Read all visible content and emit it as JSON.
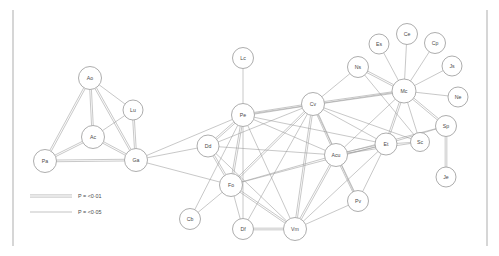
{
  "figure": {
    "kind": "network-graph",
    "background_color": "#ffffff",
    "node_fill": "#ffffff",
    "node_stroke": "#8a8a8a",
    "edge_color": "#9a9a9a",
    "frame_color": "#b5b5b5",
    "label_color": "#4a4a4a"
  },
  "frame": {
    "left_rule": {
      "x": 13,
      "y1": 10,
      "y2": 246
    },
    "right_rule": {
      "x": 487,
      "y1": 10,
      "y2": 246
    }
  },
  "legend": {
    "items": [
      {
        "id": "legend-strong",
        "style": "double",
        "label": "P = <0·01"
      },
      {
        "id": "legend-weak",
        "style": "single",
        "label": "P = <0·05"
      }
    ]
  },
  "chart_data": {
    "type": "scatter",
    "title": "",
    "xlabel": "",
    "ylabel": "",
    "nodes": [
      {
        "id": "Pa",
        "label": "Pa",
        "x": 45,
        "y": 161,
        "r": 11.5
      },
      {
        "id": "Ao",
        "label": "Ao",
        "x": 90,
        "y": 78,
        "r": 11.5
      },
      {
        "id": "Ac",
        "label": "Ac",
        "x": 93,
        "y": 137,
        "r": 11.5
      },
      {
        "id": "Lu",
        "label": "Lu",
        "x": 133,
        "y": 110,
        "r": 10.0
      },
      {
        "id": "Ga",
        "label": "Ga",
        "x": 136,
        "y": 160,
        "r": 11.5
      },
      {
        "id": "Lc",
        "label": "Lc",
        "x": 243,
        "y": 58,
        "r": 10.5
      },
      {
        "id": "Pe",
        "label": "Pe",
        "x": 243,
        "y": 115,
        "r": 11.5
      },
      {
        "id": "Dd",
        "label": "Dd",
        "x": 208,
        "y": 146,
        "r": 11.0
      },
      {
        "id": "Fo",
        "label": "Fo",
        "x": 231,
        "y": 185,
        "r": 11.5
      },
      {
        "id": "Cb",
        "label": "Cb",
        "x": 190,
        "y": 219,
        "r": 10.5
      },
      {
        "id": "Df",
        "label": "Df",
        "x": 243,
        "y": 229,
        "r": 10.5
      },
      {
        "id": "Vm",
        "label": "Vm",
        "x": 295,
        "y": 229,
        "r": 11.5
      },
      {
        "id": "Cv",
        "label": "Cv",
        "x": 313,
        "y": 104,
        "r": 11.5
      },
      {
        "id": "Acu",
        "label": "Acu",
        "x": 336,
        "y": 155,
        "r": 11.5
      },
      {
        "id": "Et",
        "label": "Et",
        "x": 386,
        "y": 144,
        "r": 11.0
      },
      {
        "id": "Pv",
        "label": "Pv",
        "x": 358,
        "y": 201,
        "r": 10.5
      },
      {
        "id": "Mc",
        "label": "Mc",
        "x": 404,
        "y": 91,
        "r": 12.0
      },
      {
        "id": "Ns",
        "label": "Ns",
        "x": 358,
        "y": 67,
        "r": 10.5
      },
      {
        "id": "Es",
        "label": "Es",
        "x": 379,
        "y": 44,
        "r": 10.0
      },
      {
        "id": "Ce",
        "label": "Ce",
        "x": 407,
        "y": 34,
        "r": 10.5
      },
      {
        "id": "Cp",
        "label": "Cp",
        "x": 435,
        "y": 43,
        "r": 10.5
      },
      {
        "id": "Js",
        "label": "Js",
        "x": 452,
        "y": 66,
        "r": 10.0
      },
      {
        "id": "Ne",
        "label": "Ne",
        "x": 458,
        "y": 97,
        "r": 10.0
      },
      {
        "id": "Sp",
        "label": "Sp",
        "x": 446,
        "y": 126,
        "r": 10.5
      },
      {
        "id": "Sc",
        "label": "Sc",
        "x": 420,
        "y": 142,
        "r": 9.5
      },
      {
        "id": "Je",
        "label": "Je",
        "x": 446,
        "y": 177,
        "r": 10.0
      }
    ],
    "edges": [
      {
        "source": "Pa",
        "target": "Ao",
        "weight": "double"
      },
      {
        "source": "Pa",
        "target": "Ac",
        "weight": "double"
      },
      {
        "source": "Pa",
        "target": "Ga",
        "weight": "double"
      },
      {
        "source": "Ao",
        "target": "Ac",
        "weight": "double"
      },
      {
        "source": "Ao",
        "target": "Ga",
        "weight": "double"
      },
      {
        "source": "Ao",
        "target": "Lu",
        "weight": "single"
      },
      {
        "source": "Ac",
        "target": "Ga",
        "weight": "double"
      },
      {
        "source": "Ac",
        "target": "Lu",
        "weight": "single"
      },
      {
        "source": "Lu",
        "target": "Ga",
        "weight": "double"
      },
      {
        "source": "Ga",
        "target": "Pe",
        "weight": "single"
      },
      {
        "source": "Ga",
        "target": "Dd",
        "weight": "single"
      },
      {
        "source": "Ga",
        "target": "Fo",
        "weight": "single"
      },
      {
        "source": "Lc",
        "target": "Pe",
        "weight": "single"
      },
      {
        "source": "Pe",
        "target": "Dd",
        "weight": "double"
      },
      {
        "source": "Pe",
        "target": "Fo",
        "weight": "double"
      },
      {
        "source": "Pe",
        "target": "Cv",
        "weight": "double"
      },
      {
        "source": "Pe",
        "target": "Acu",
        "weight": "single"
      },
      {
        "source": "Pe",
        "target": "Vm",
        "weight": "single"
      },
      {
        "source": "Pe",
        "target": "Df",
        "weight": "single"
      },
      {
        "source": "Pe",
        "target": "Mc",
        "weight": "single"
      },
      {
        "source": "Pe",
        "target": "Et",
        "weight": "single"
      },
      {
        "source": "Dd",
        "target": "Fo",
        "weight": "double"
      },
      {
        "source": "Dd",
        "target": "Acu",
        "weight": "single"
      },
      {
        "source": "Dd",
        "target": "Cv",
        "weight": "single"
      },
      {
        "source": "Dd",
        "target": "Vm",
        "weight": "single"
      },
      {
        "source": "Fo",
        "target": "Cb",
        "weight": "single"
      },
      {
        "source": "Fo",
        "target": "Df",
        "weight": "single"
      },
      {
        "source": "Fo",
        "target": "Vm",
        "weight": "double"
      },
      {
        "source": "Fo",
        "target": "Cv",
        "weight": "double"
      },
      {
        "source": "Fo",
        "target": "Acu",
        "weight": "single"
      },
      {
        "source": "Fo",
        "target": "Et",
        "weight": "single"
      },
      {
        "source": "Cb",
        "target": "Pe",
        "weight": "single"
      },
      {
        "source": "Df",
        "target": "Vm",
        "weight": "double"
      },
      {
        "source": "Df",
        "target": "Cv",
        "weight": "single"
      },
      {
        "source": "Vm",
        "target": "Cv",
        "weight": "double"
      },
      {
        "source": "Vm",
        "target": "Acu",
        "weight": "double"
      },
      {
        "source": "Vm",
        "target": "Et",
        "weight": "single"
      },
      {
        "source": "Vm",
        "target": "Pv",
        "weight": "single"
      },
      {
        "source": "Cv",
        "target": "Acu",
        "weight": "double"
      },
      {
        "source": "Cv",
        "target": "Et",
        "weight": "single"
      },
      {
        "source": "Cv",
        "target": "Mc",
        "weight": "double"
      },
      {
        "source": "Cv",
        "target": "Ns",
        "weight": "single"
      },
      {
        "source": "Cv",
        "target": "Sc",
        "weight": "single"
      },
      {
        "source": "Cv",
        "target": "Pv",
        "weight": "single"
      },
      {
        "source": "Acu",
        "target": "Et",
        "weight": "double"
      },
      {
        "source": "Acu",
        "target": "Pv",
        "weight": "double"
      },
      {
        "source": "Acu",
        "target": "Mc",
        "weight": "single"
      },
      {
        "source": "Acu",
        "target": "Sc",
        "weight": "single"
      },
      {
        "source": "Acu",
        "target": "Sp",
        "weight": "single"
      },
      {
        "source": "Et",
        "target": "Mc",
        "weight": "double"
      },
      {
        "source": "Et",
        "target": "Sp",
        "weight": "single"
      },
      {
        "source": "Et",
        "target": "Sc",
        "weight": "single"
      },
      {
        "source": "Et",
        "target": "Pv",
        "weight": "single"
      },
      {
        "source": "Mc",
        "target": "Ns",
        "weight": "double"
      },
      {
        "source": "Mc",
        "target": "Es",
        "weight": "single"
      },
      {
        "source": "Mc",
        "target": "Ce",
        "weight": "single"
      },
      {
        "source": "Mc",
        "target": "Cp",
        "weight": "single"
      },
      {
        "source": "Mc",
        "target": "Js",
        "weight": "single"
      },
      {
        "source": "Mc",
        "target": "Ne",
        "weight": "single"
      },
      {
        "source": "Mc",
        "target": "Sp",
        "weight": "double"
      },
      {
        "source": "Mc",
        "target": "Sc",
        "weight": "single"
      },
      {
        "source": "Ns",
        "target": "Sc",
        "weight": "single"
      },
      {
        "source": "Sp",
        "target": "Je",
        "weight": "double"
      }
    ]
  }
}
